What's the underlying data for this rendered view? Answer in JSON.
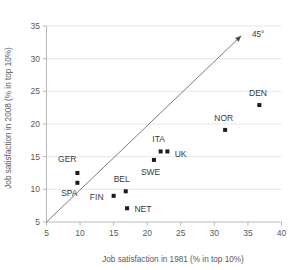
{
  "chart_data": {
    "type": "scatter",
    "title": "",
    "xlabel": "Job satisfaction in 1981 (% in top 10%)",
    "ylabel": "Job satisfaction in 2008 (% in top 10%)",
    "xlim": [
      5,
      40
    ],
    "ylim": [
      5,
      35
    ],
    "xticks": [
      5,
      10,
      15,
      20,
      25,
      30,
      35,
      40
    ],
    "yticks": [
      5,
      10,
      15,
      20,
      25,
      30,
      35
    ],
    "xtick_labels": [
      "5",
      "10",
      "15",
      "20",
      "25",
      "30",
      "35",
      "40"
    ],
    "ytick_labels": [
      "5",
      "10",
      "15",
      "20",
      "25",
      "30",
      "35"
    ],
    "grid": "horizontal",
    "legend": "none",
    "points": [
      {
        "label": "GER",
        "x": 9.6,
        "y": 12.5,
        "label_dx": -1.5,
        "label_dy": 2.2,
        "anchor": "middle"
      },
      {
        "label": "SPA",
        "x": 9.6,
        "y": 11.0,
        "label_dx": -1.2,
        "label_dy": -1.6,
        "anchor": "middle"
      },
      {
        "label": "FIN",
        "x": 15.0,
        "y": 9.0,
        "label_dx": -1.5,
        "label_dy": -0.1,
        "anchor": "end"
      },
      {
        "label": "BEL",
        "x": 16.8,
        "y": 9.7,
        "label_dx": -0.6,
        "label_dy": 1.9,
        "anchor": "middle"
      },
      {
        "label": "NET",
        "x": 17.0,
        "y": 7.1,
        "label_dx": 1.1,
        "label_dy": -0.1,
        "anchor": "start"
      },
      {
        "label": "SWE",
        "x": 21.0,
        "y": 14.5,
        "label_dx": -0.5,
        "label_dy": -1.9,
        "anchor": "middle"
      },
      {
        "label": "ITA",
        "x": 22.0,
        "y": 15.8,
        "label_dx": -0.3,
        "label_dy": 1.9,
        "anchor": "middle"
      },
      {
        "label": "UK",
        "x": 23.0,
        "y": 15.8,
        "label_dx": 1.1,
        "label_dy": -0.3,
        "anchor": "start"
      },
      {
        "label": "NOR",
        "x": 31.6,
        "y": 19.1,
        "label_dx": -0.2,
        "label_dy": 1.9,
        "anchor": "middle"
      },
      {
        "label": "DEN",
        "x": 36.7,
        "y": 22.9,
        "label_dx": -0.2,
        "label_dy": 1.9,
        "anchor": "middle"
      }
    ],
    "reference_line": {
      "name": "45-degree-line",
      "label": "45°",
      "from": [
        5,
        5
      ],
      "to": [
        34,
        33.5
      ],
      "arrow_at_end": true,
      "label_x": 35.6,
      "label_y": 33.8
    }
  }
}
